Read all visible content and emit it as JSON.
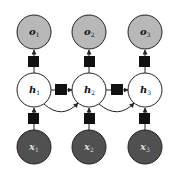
{
  "diagram": {
    "type": "factor-graph / hidden-state sequence model",
    "colors": {
      "observed_output_fill": "#b8b8b8",
      "input_fill": "#505050",
      "hidden_fill": "#ffffff",
      "stroke": "#222222",
      "factor_fill": "#111111",
      "input_label": "#dddddd",
      "label": "#111111"
    },
    "columns_x": [
      34,
      89,
      145
    ],
    "rows_y": {
      "output": 32,
      "hidden": 90,
      "input": 147
    },
    "radius": 17,
    "outputs": [
      {
        "name": "o",
        "sub": "1"
      },
      {
        "name": "o",
        "sub": "2"
      },
      {
        "name": "o",
        "sub": "3"
      }
    ],
    "hidden": [
      {
        "name": "h",
        "sub": "1"
      },
      {
        "name": "h",
        "sub": "2"
      },
      {
        "name": "h",
        "sub": "3"
      }
    ],
    "inputs": [
      {
        "name": "x",
        "sub": "1"
      },
      {
        "name": "x",
        "sub": "2"
      },
      {
        "name": "x",
        "sub": "3"
      }
    ],
    "edges": [
      "x1->h1",
      "x2->h2",
      "x3->h3",
      "h1->o1",
      "h2->o2",
      "h3->o3",
      "h1->h2",
      "h2->h3",
      "h1~>h2 (curved skip)",
      "h2~>h3 (curved skip)"
    ]
  }
}
